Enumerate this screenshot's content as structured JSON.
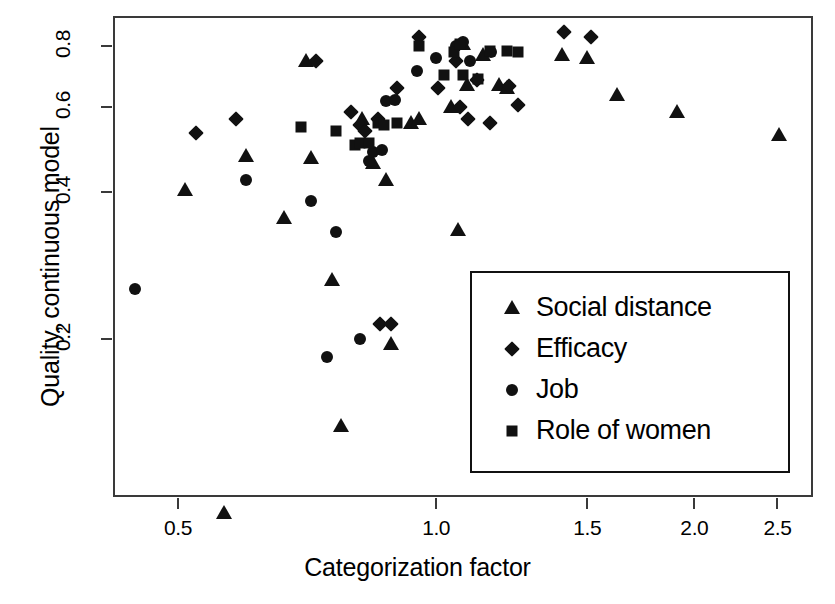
{
  "chart_data": {
    "type": "scatter",
    "title": "",
    "xlabel": "Categorization factor",
    "ylabel": "Quality, continuous model",
    "xscale": "log",
    "yscale": "log",
    "xlim": [
      0.42,
      2.75
    ],
    "ylim": [
      0.095,
      0.92
    ],
    "xticks": [
      0.5,
      1.0,
      1.5,
      2.0,
      2.5
    ],
    "xticklabels": [
      "0.5",
      "1.0",
      "1.5",
      "2.0",
      "2.5"
    ],
    "yticks": [
      0.2,
      0.4,
      0.6,
      0.8
    ],
    "yticklabels": [
      "0.2",
      "0.4",
      "0.6",
      "0.8"
    ],
    "grid": false,
    "legend_position": "lower right",
    "series": [
      {
        "name": "Social distance",
        "marker": "triangle",
        "color": "#111111",
        "points": [
          [
            0.51,
            0.405
          ],
          [
            0.565,
            0.088
          ],
          [
            0.6,
            0.475
          ],
          [
            0.665,
            0.355
          ],
          [
            0.705,
            0.745
          ],
          [
            0.715,
            0.47
          ],
          [
            0.755,
            0.265
          ],
          [
            0.775,
            0.133
          ],
          [
            0.82,
            0.565
          ],
          [
            0.845,
            0.46
          ],
          [
            0.875,
            0.425
          ],
          [
            0.885,
            0.196
          ],
          [
            0.935,
            0.555
          ],
          [
            0.955,
            0.565
          ],
          [
            1.04,
            0.6
          ],
          [
            1.06,
            0.335
          ],
          [
            1.075,
            0.805
          ],
          [
            1.085,
            0.665
          ],
          [
            1.135,
            0.765
          ],
          [
            1.185,
            0.665
          ],
          [
            1.21,
            0.655
          ],
          [
            1.4,
            0.765
          ],
          [
            1.5,
            0.755
          ],
          [
            1.625,
            0.635
          ],
          [
            1.91,
            0.585
          ],
          [
            2.51,
            0.525
          ]
        ]
      },
      {
        "name": "Efficacy",
        "marker": "diamond",
        "color": "#111111",
        "points": [
          [
            0.525,
            0.53
          ],
          [
            0.585,
            0.565
          ],
          [
            0.725,
            0.745
          ],
          [
            0.795,
            0.585
          ],
          [
            0.815,
            0.55
          ],
          [
            0.825,
            0.535
          ],
          [
            0.855,
            0.565
          ],
          [
            0.86,
            0.215
          ],
          [
            0.885,
            0.215
          ],
          [
            0.9,
            0.655
          ],
          [
            0.955,
            0.835
          ],
          [
            1.005,
            0.655
          ],
          [
            1.055,
            0.745
          ],
          [
            1.065,
            0.6
          ],
          [
            1.09,
            0.565
          ],
          [
            1.115,
            0.68
          ],
          [
            1.155,
            0.555
          ],
          [
            1.215,
            0.66
          ],
          [
            1.245,
            0.605
          ],
          [
            1.41,
            0.855
          ],
          [
            1.515,
            0.835
          ]
        ]
      },
      {
        "name": "Job",
        "marker": "circle",
        "color": "#111111",
        "points": [
          [
            0.445,
            0.254
          ],
          [
            0.6,
            0.425
          ],
          [
            0.715,
            0.385
          ],
          [
            0.745,
            0.184
          ],
          [
            0.765,
            0.332
          ],
          [
            0.815,
            0.2
          ],
          [
            0.835,
            0.465
          ],
          [
            0.845,
            0.485
          ],
          [
            0.865,
            0.49
          ],
          [
            0.875,
            0.615
          ],
          [
            0.895,
            0.62
          ],
          [
            0.95,
            0.71
          ],
          [
            1.0,
            0.755
          ],
          [
            1.055,
            0.8
          ],
          [
            1.075,
            0.815
          ],
          [
            1.095,
            0.745
          ],
          [
            1.16,
            0.775
          ]
        ]
      },
      {
        "name": "Role of women",
        "marker": "square",
        "color": "#111111",
        "points": [
          [
            0.695,
            0.545
          ],
          [
            0.765,
            0.535
          ],
          [
            0.805,
            0.5
          ],
          [
            0.815,
            0.505
          ],
          [
            0.835,
            0.505
          ],
          [
            0.855,
            0.555
          ],
          [
            0.87,
            0.55
          ],
          [
            0.9,
            0.555
          ],
          [
            0.955,
            0.8
          ],
          [
            1.02,
            0.695
          ],
          [
            1.05,
            0.775
          ],
          [
            1.065,
            0.805
          ],
          [
            1.075,
            0.695
          ],
          [
            1.12,
            0.685
          ],
          [
            1.155,
            0.78
          ],
          [
            1.21,
            0.78
          ],
          [
            1.245,
            0.775
          ]
        ]
      }
    ]
  },
  "axes": {
    "x": {
      "label": "Categorization factor",
      "ticks": [
        {
          "value": 0.5,
          "label": "0.5"
        },
        {
          "value": 1.0,
          "label": "1.0"
        },
        {
          "value": 1.5,
          "label": "1.5"
        },
        {
          "value": 2.0,
          "label": "2.0"
        },
        {
          "value": 2.5,
          "label": "2.5"
        }
      ]
    },
    "y": {
      "label": "Quality, continuous model",
      "ticks": [
        {
          "value": 0.2,
          "label": "0.2"
        },
        {
          "value": 0.4,
          "label": "0.4"
        },
        {
          "value": 0.6,
          "label": "0.6"
        },
        {
          "value": 0.8,
          "label": "0.8"
        }
      ]
    }
  },
  "legend": {
    "entries": [
      {
        "label": "Social distance",
        "marker": "triangle"
      },
      {
        "label": "Efficacy",
        "marker": "diamond"
      },
      {
        "label": "Job",
        "marker": "circle"
      },
      {
        "label": "Role of women",
        "marker": "square"
      }
    ]
  },
  "colors": {
    "marker": "#111111",
    "frame": "#3a3a3a",
    "background": "#ffffff"
  }
}
